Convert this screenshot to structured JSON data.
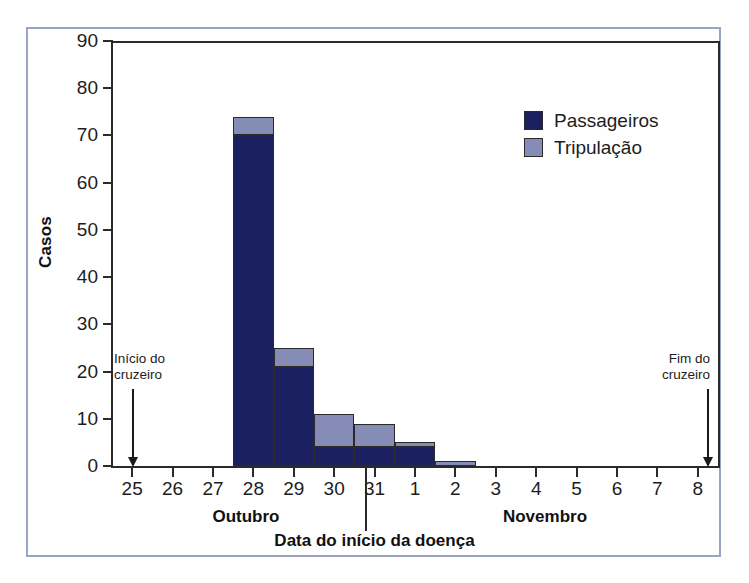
{
  "chart_data": {
    "type": "bar",
    "subtype": "stacked-histogram",
    "title": "",
    "xlabel": "Data do início da doença",
    "ylabel": "Casos",
    "ylim": [
      0,
      90
    ],
    "ytick_step": 10,
    "yticks": [
      90,
      80,
      70,
      60,
      50,
      40,
      30,
      20,
      10,
      0
    ],
    "grid": false,
    "legend_position": "upper right",
    "categories": [
      "25",
      "26",
      "27",
      "28",
      "29",
      "30",
      "31",
      "1",
      "2",
      "3",
      "4",
      "5",
      "6",
      "7",
      "8"
    ],
    "xtick_labels": [
      "25",
      "26",
      "27",
      "28",
      "29",
      "30",
      "31",
      "1",
      "2",
      "3",
      "4",
      "5",
      "6",
      "7",
      "8"
    ],
    "group_labels": [
      "Outubro",
      "Novembro"
    ],
    "series": [
      {
        "name": "Passageiros",
        "color": "#1a2060",
        "values": [
          0,
          0,
          0,
          70,
          21,
          4,
          4,
          4,
          0,
          0,
          0,
          0,
          0,
          0,
          0
        ]
      },
      {
        "name": "Tripulação",
        "color": "#858cb6",
        "values": [
          0,
          0,
          0,
          4,
          4,
          7,
          5,
          1,
          1,
          0,
          0,
          0,
          0,
          0,
          0
        ]
      }
    ],
    "totals": [
      0,
      0,
      0,
      74,
      25,
      11,
      9,
      5,
      1,
      0,
      0,
      0,
      0,
      0,
      0
    ],
    "annotations": [
      {
        "id": "cruise-start",
        "text_lines": [
          "Início do",
          "cruzeiro"
        ],
        "at_category": "25",
        "marker": "down-arrow"
      },
      {
        "id": "cruise-end",
        "text_lines": [
          "Fim do",
          "cruzeiro"
        ],
        "at_category": "8",
        "marker": "down-arrow"
      }
    ]
  },
  "legend": {
    "items": [
      {
        "label": "Passageiros",
        "color": "#1a2060"
      },
      {
        "label": "Tripulação",
        "color": "#858cb6"
      }
    ]
  },
  "axes": {
    "y_title": "Casos",
    "x_title": "Data do início da doença",
    "y_tick_labels": [
      "90",
      "80",
      "70",
      "60",
      "50",
      "40",
      "30",
      "20",
      "10",
      "0"
    ],
    "x_tick_labels": [
      "25",
      "26",
      "27",
      "28",
      "29",
      "30",
      "31",
      "1",
      "2",
      "3",
      "4",
      "5",
      "6",
      "7",
      "8"
    ],
    "month_left": "Outubro",
    "month_right": "Novembro"
  },
  "annotations": {
    "start": {
      "line1": "Início do",
      "line2": "cruzeiro"
    },
    "end": {
      "line1": "Fim do",
      "line2": "cruzeiro"
    }
  },
  "colors": {
    "passengers": "#1a2060",
    "crew": "#858cb6",
    "axis": "#2a2a2a",
    "frame": "#9aa3c4",
    "background": "#ffffff"
  }
}
